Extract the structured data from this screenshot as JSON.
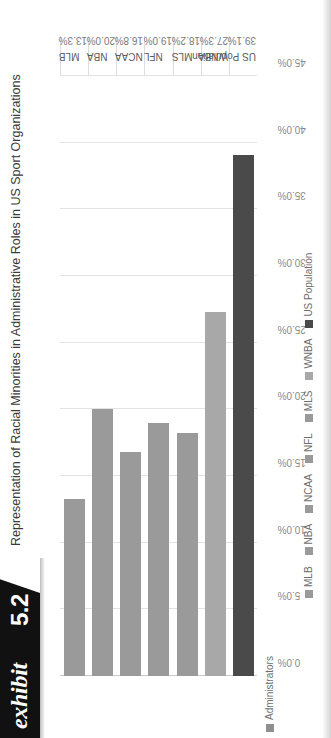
{
  "exhibit": {
    "word": "exhibit",
    "number": "5.2"
  },
  "header": {
    "title": "Representation of Racial Minorities in Administrative Roles in US Sport Organizations"
  },
  "series_legend": {
    "swatch": "legend-swatch-icon",
    "label": "Administrators",
    "color": "#8f8f8f"
  },
  "chart_data": {
    "type": "bar",
    "orientation": "vertical",
    "title": "Representation of Racial Minorities in Administrative Roles in US Sport Organizations",
    "xlabel": "",
    "ylabel": "",
    "ylim": [
      0,
      45
    ],
    "grid": true,
    "legend_position": "bottom",
    "series_name": "Administrators",
    "categories": [
      "MLB",
      "NBA",
      "NCAA",
      "NFL",
      "MLS",
      "WNBA",
      "US Population"
    ],
    "values": [
      13.3,
      20.0,
      16.8,
      19.0,
      18.2,
      27.3,
      39.1
    ],
    "value_labels": [
      "13.3%",
      "20.0%",
      "16.8%",
      "19.0%",
      "18.2%",
      "27.3%",
      "39.1%"
    ],
    "bar_colors": [
      "#9a9a9a",
      "#9a9a9a",
      "#9a9a9a",
      "#9a9a9a",
      "#9a9a9a",
      "#a8a8a8",
      "#4a4a4a"
    ],
    "tick_labels": [
      "45.0%",
      "40.0%",
      "35.0%",
      "30.0%",
      "25.0%",
      "20.0%",
      "15.0%",
      "10.0%",
      "5.0%",
      "0.0%"
    ],
    "tick_values": [
      45,
      40,
      35,
      30,
      25,
      20,
      15,
      10,
      5,
      0
    ]
  }
}
